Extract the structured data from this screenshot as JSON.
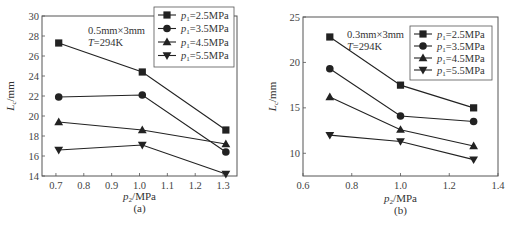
{
  "chart_data": [
    {
      "type": "line",
      "panel_label": "(a)",
      "title": "",
      "annotation": [
        "0.5mm×3mm",
        "T=294K"
      ],
      "xlabel": "p2/MPa",
      "ylabel": "Lc/mm",
      "xlim": [
        0.65,
        1.35
      ],
      "ylim": [
        14,
        30
      ],
      "xticks": [
        0.7,
        0.8,
        0.9,
        1.0,
        1.1,
        1.2,
        1.3
      ],
      "xtick_labels": [
        "0.7",
        "0.8",
        "0.9",
        "1.0",
        "1.1",
        "1.2",
        "1.3"
      ],
      "yticks": [
        14,
        16,
        18,
        20,
        22,
        24,
        26,
        28,
        30
      ],
      "ytick_labels": [
        "14",
        "16",
        "18",
        "20",
        "22",
        "24",
        "26",
        "28",
        "30"
      ],
      "grid": false,
      "legend_position": "upper right",
      "x": [
        0.71,
        1.01,
        1.31
      ],
      "series": [
        {
          "name": "p1=2.5MPa",
          "marker": "square",
          "values": [
            27.3,
            24.4,
            18.6
          ]
        },
        {
          "name": "p1=3.5MPa",
          "marker": "circle",
          "values": [
            21.9,
            22.1,
            16.4
          ]
        },
        {
          "name": "p1=4.5MPa",
          "marker": "triangle-up",
          "values": [
            19.4,
            18.6,
            17.2
          ]
        },
        {
          "name": "p1=5.5MPa",
          "marker": "triangle-down",
          "values": [
            16.6,
            17.1,
            14.2
          ]
        }
      ]
    },
    {
      "type": "line",
      "panel_label": "(b)",
      "title": "",
      "annotation": [
        "0.3mm×3mm",
        "T=294K"
      ],
      "xlabel": "p2/MPa",
      "ylabel": "Lc/mm",
      "xlim": [
        0.6,
        1.4
      ],
      "ylim": [
        7.5,
        25
      ],
      "xticks": [
        0.6,
        0.8,
        1.0,
        1.2,
        1.4
      ],
      "xtick_labels": [
        "0.6",
        "0.8",
        "1.0",
        "1.2",
        "1.4"
      ],
      "yticks": [
        10,
        15,
        20,
        25
      ],
      "ytick_labels": [
        "10",
        "15",
        "20",
        "25"
      ],
      "grid": false,
      "legend_position": "upper right",
      "x": [
        0.71,
        1.0,
        1.3
      ],
      "series": [
        {
          "name": "p1=2.5MPa",
          "marker": "square",
          "values": [
            22.8,
            17.5,
            15.0
          ]
        },
        {
          "name": "p1=3.5MPa",
          "marker": "circle",
          "values": [
            19.3,
            14.1,
            13.5
          ]
        },
        {
          "name": "p1=4.5MPa",
          "marker": "triangle-up",
          "values": [
            16.2,
            12.6,
            10.8
          ]
        },
        {
          "name": "p1=5.5MPa",
          "marker": "triangle-down",
          "values": [
            12.0,
            11.3,
            9.3
          ]
        }
      ]
    }
  ],
  "labels": {
    "a": {
      "panel": "(a)",
      "xlabel_var": "p",
      "xlabel_sub": "2",
      "xlabel_unit": "/MPa",
      "ylabel_var": "L",
      "ylabel_sub": "c",
      "ylabel_unit": "/mm",
      "ann1": "0.5mm×3mm",
      "ann2_var": "T",
      "ann2_rest": "=294K"
    },
    "b": {
      "panel": "(b)",
      "xlabel_var": "p",
      "xlabel_sub": "2",
      "xlabel_unit": "/MPa",
      "ylabel_var": "L",
      "ylabel_sub": "c",
      "ylabel_unit": "/mm",
      "ann1": "0.3mm×3mm",
      "ann2_var": "T",
      "ann2_rest": "=294K"
    },
    "legend": [
      {
        "var": "p",
        "sub": "1",
        "rest": "=2.5MPa"
      },
      {
        "var": "p",
        "sub": "1",
        "rest": "=3.5MPa"
      },
      {
        "var": "p",
        "sub": "1",
        "rest": "=4.5MPa"
      },
      {
        "var": "p",
        "sub": "1",
        "rest": "=5.5MPa"
      }
    ]
  },
  "colors": {
    "line": "#222222",
    "axis": "#555555",
    "text": "#333333"
  }
}
